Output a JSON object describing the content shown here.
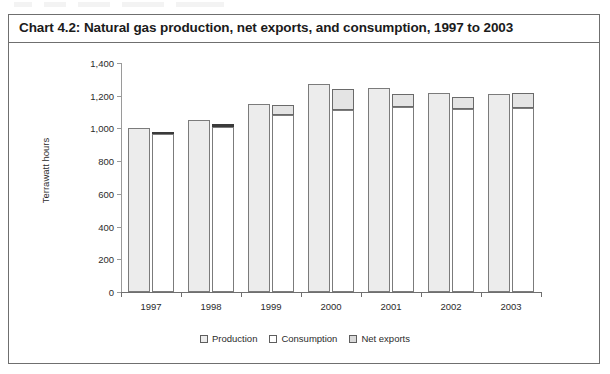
{
  "chart_title": "Chart 4.2:  Natural gas production, net exports, and consumption, 1997 to 2003",
  "chart_data": {
    "type": "bar",
    "title": "Chart 4.2:  Natural gas production, net exports, and consumption, 1997 to 2003",
    "subtitle": "",
    "xlabel": "",
    "ylabel": "Terrawatt hours",
    "categories": [
      "1997",
      "1998",
      "1999",
      "2000",
      "2001",
      "2002",
      "2003"
    ],
    "ylim": [
      0,
      1400
    ],
    "yticks": [
      "0",
      "200",
      "400",
      "600",
      "800",
      "1,000",
      "1,200",
      "1,400"
    ],
    "ytick_values": [
      0,
      200,
      400,
      600,
      800,
      1000,
      1200,
      1400
    ],
    "grid": false,
    "legend_position": "bottom-center",
    "legend": [
      "Production",
      "Consumption",
      "Net exports"
    ],
    "series": [
      {
        "name": "Production",
        "type": "bar",
        "values": [
          1000,
          1050,
          1150,
          1270,
          1245,
          1215,
          1210
        ]
      },
      {
        "name": "Consumption",
        "type": "bar-stacked-base",
        "values": [
          965,
          1010,
          1080,
          1115,
          1130,
          1120,
          1125
        ]
      },
      {
        "name": "Net exports",
        "type": "bar-stacked-top",
        "values": [
          5,
          15,
          65,
          125,
          80,
          75,
          90
        ]
      }
    ],
    "colors": {
      "production": "#ececec",
      "consumption": "#ffffff",
      "net_exports": "#e4e4e4",
      "bar_outline": "#7b7b7b",
      "axis": "#6f6f6f",
      "text": "#2b2b2b"
    }
  }
}
